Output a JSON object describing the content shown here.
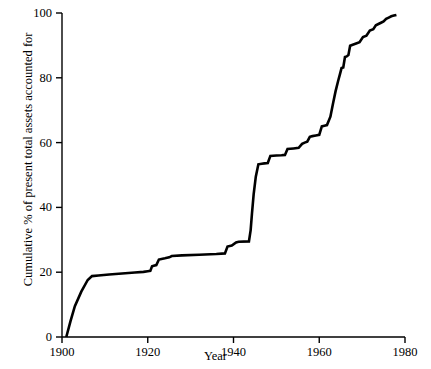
{
  "chart_data": {
    "type": "line",
    "title": "",
    "subtitle": "",
    "xlabel": "Year",
    "ylabel": "Cumulative % of present total assets accounted for",
    "xlim": [
      1900,
      1980
    ],
    "ylim": [
      0,
      100
    ],
    "xticks": [
      1900,
      1920,
      1940,
      1960,
      1980
    ],
    "xtick_labels": [
      "1900",
      "1920",
      "1940",
      "1960",
      "1980"
    ],
    "yticks": [
      0,
      20,
      40,
      60,
      80,
      100
    ],
    "ytick_labels": [
      "0",
      "20",
      "40",
      "60",
      "80",
      "100"
    ],
    "grid": false,
    "legend": null,
    "legend_position": "none",
    "line_color": "#000000",
    "line_width": 2.6,
    "series": [
      {
        "name": "Cumulative % of present total assets accounted for",
        "x": [
          1901.0,
          1902.0,
          1903.0,
          1904.5,
          1906.0,
          1907.0,
          1908.5,
          1911.0,
          1914.0,
          1917.0,
          1919.0,
          1920.0,
          1920.6,
          1921.0,
          1921.4,
          1922.0,
          1922.6,
          1923.2,
          1924.0,
          1925.0,
          1925.6,
          1928.0,
          1932.0,
          1936.0,
          1938.0,
          1938.6,
          1939.6,
          1940.6,
          1941.2,
          1943.6,
          1944.0,
          1944.3,
          1944.7,
          1945.2,
          1945.8,
          1946.6,
          1947.2,
          1948.0,
          1948.6,
          1950.0,
          1951.2,
          1952.0,
          1952.6,
          1954.0,
          1955.2,
          1956.0,
          1956.6,
          1957.2,
          1957.8,
          1958.4,
          1959.2,
          1960.0,
          1960.6,
          1961.2,
          1961.8,
          1962.6,
          1963.2,
          1963.8,
          1964.4,
          1964.8,
          1965.2,
          1965.6,
          1966.0,
          1966.4,
          1966.8,
          1967.2,
          1967.8,
          1968.6,
          1969.4,
          1970.2,
          1971.0,
          1971.8,
          1972.6,
          1973.2,
          1973.8,
          1974.4,
          1975.0,
          1975.6,
          1976.2,
          1976.8,
          1977.4,
          1978.0
        ],
        "y": [
          0.0,
          5.0,
          9.5,
          14.0,
          17.6,
          18.8,
          19.0,
          19.3,
          19.6,
          19.9,
          20.1,
          20.3,
          20.4,
          21.8,
          22.0,
          22.2,
          23.9,
          24.1,
          24.3,
          24.6,
          25.0,
          25.2,
          25.4,
          25.6,
          25.8,
          27.9,
          28.2,
          29.2,
          29.4,
          29.5,
          33.0,
          38.0,
          44.0,
          49.5,
          53.3,
          53.5,
          53.6,
          53.7,
          55.9,
          56.0,
          56.1,
          56.2,
          58.0,
          58.2,
          58.4,
          59.6,
          60.0,
          60.3,
          61.8,
          62.0,
          62.2,
          62.4,
          65.0,
          65.2,
          65.4,
          68.0,
          72.0,
          75.8,
          79.0,
          81.0,
          83.0,
          83.2,
          86.4,
          86.6,
          87.0,
          89.9,
          90.2,
          90.6,
          91.0,
          92.6,
          93.0,
          94.6,
          95.0,
          96.2,
          96.6,
          97.0,
          97.4,
          98.2,
          98.6,
          99.0,
          99.2,
          99.4
        ]
      }
    ],
    "annotations": []
  },
  "axes": {
    "y_ticks": [
      {
        "value": 100,
        "label": "100"
      },
      {
        "value": 80,
        "label": "80"
      },
      {
        "value": 60,
        "label": "60"
      },
      {
        "value": 40,
        "label": "40"
      },
      {
        "value": 20,
        "label": "20"
      },
      {
        "value": 0,
        "label": "0"
      }
    ],
    "x_ticks": [
      {
        "value": 1900,
        "label": "1900"
      },
      {
        "value": 1920,
        "label": "1920"
      },
      {
        "value": 1940,
        "label": "1940"
      },
      {
        "value": 1960,
        "label": "1960"
      },
      {
        "value": 1980,
        "label": "1980"
      }
    ],
    "y_axis_title": "Cumulative % of present total assets accounted for",
    "x_axis_title": "Year"
  }
}
